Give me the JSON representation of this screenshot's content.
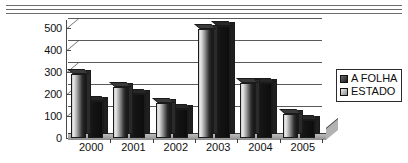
{
  "chart_data": {
    "type": "bar",
    "title": "",
    "xlabel": "",
    "ylabel": "",
    "categories": [
      "2000",
      "2001",
      "2002",
      "2003",
      "2004",
      "2005"
    ],
    "series": [
      {
        "name": "A FOLHA",
        "color": "#1d1d1d",
        "values": [
          290,
          230,
          160,
          495,
          250,
          110
        ]
      },
      {
        "name": "ESTADO",
        "color": "#8a8a8a",
        "values": [
          170,
          200,
          130,
          510,
          250,
          80
        ]
      }
    ],
    "ylim": [
      0,
      500
    ],
    "yticks": [
      0,
      100,
      200,
      300,
      400,
      500
    ],
    "ytick_labels": [
      "0",
      "100",
      "200",
      "300",
      "400",
      "500"
    ],
    "grid": true,
    "legend_position": "right",
    "style": "3d-grouped-column"
  },
  "legend": {
    "items": [
      {
        "label": "A FOLHA",
        "swatch": "dark-swatch-icon"
      },
      {
        "label": "ESTADO",
        "swatch": "light-swatch-icon"
      }
    ]
  }
}
